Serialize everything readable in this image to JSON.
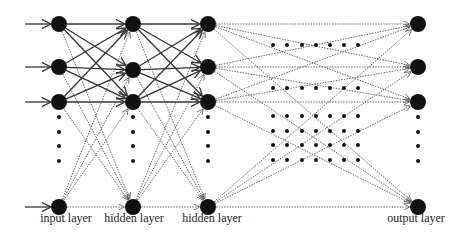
{
  "diagram": {
    "type": "feedforward-neural-network",
    "layers": [
      {
        "id": "input",
        "label": "input layer",
        "x": 59,
        "node_ys": [
          24,
          67,
          102,
          207
        ],
        "ellipsis_ys": [
          117,
          132,
          146,
          161
        ]
      },
      {
        "id": "hidden1",
        "label": "hidden layer",
        "x": 133,
        "node_ys": [
          24,
          70,
          102,
          207
        ],
        "ellipsis_ys": [
          117,
          132,
          146,
          161
        ]
      },
      {
        "id": "hidden2",
        "label": "hidden layer",
        "x": 208,
        "node_ys": [
          24,
          67,
          102,
          207
        ],
        "ellipsis_ys": [
          117,
          132,
          146,
          161
        ]
      },
      {
        "id": "output",
        "label": "output layer",
        "x": 418,
        "node_ys": [
          24,
          67,
          102,
          207
        ],
        "ellipsis_ys": [
          117,
          132,
          146,
          161
        ]
      }
    ],
    "input_arrows": {
      "from_x": 25,
      "ys": [
        24,
        67,
        102,
        207
      ]
    },
    "middle_dot_grid": {
      "xs": [
        273,
        287,
        302,
        316,
        330,
        344,
        358
      ],
      "ys": [
        45,
        88,
        116,
        131,
        145,
        160
      ]
    },
    "edge_styles": {
      "solid": "#333333",
      "dashed": "#555555"
    },
    "node_color": "#111111"
  }
}
